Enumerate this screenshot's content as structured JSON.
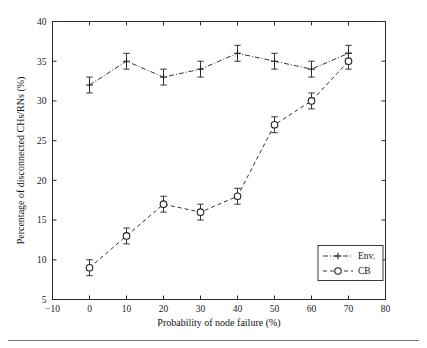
{
  "chart_data": {
    "type": "line",
    "title": "",
    "xlabel": "Probability of node failure (%)",
    "ylabel": "Percentage of disconnected CHs/RNs (%)",
    "x": [
      0,
      10,
      20,
      30,
      40,
      50,
      60,
      70
    ],
    "xlim": [
      -10,
      80
    ],
    "ylim": [
      5,
      40
    ],
    "xticks": [
      -10,
      0,
      10,
      20,
      30,
      40,
      50,
      60,
      70,
      80
    ],
    "yticks": [
      5,
      10,
      15,
      20,
      25,
      30,
      35,
      40
    ],
    "xtick_labels": [
      "−10",
      "0",
      "10",
      "20",
      "30",
      "40",
      "50",
      "60",
      "70",
      "80"
    ],
    "ytick_labels": [
      "5",
      "10",
      "15",
      "20",
      "25",
      "30",
      "35",
      "40"
    ],
    "grid": false,
    "legend_position": "lower right",
    "series": [
      {
        "name": "Env.",
        "marker": "plus",
        "linestyle": "dash-dot",
        "color": "#333333",
        "values": [
          32,
          35,
          33,
          34,
          36,
          35,
          34,
          36
        ],
        "errors": [
          1,
          1,
          1,
          1,
          1,
          1,
          1,
          1
        ]
      },
      {
        "name": "CB",
        "marker": "circle",
        "linestyle": "dashed",
        "color": "#333333",
        "values": [
          9,
          13,
          17,
          16,
          18,
          27,
          30,
          35
        ],
        "errors": [
          1,
          1,
          1,
          1,
          1,
          1,
          1,
          1
        ]
      }
    ]
  },
  "legend": {
    "entries": [
      {
        "label": "Env."
      },
      {
        "label": "CB"
      }
    ]
  }
}
